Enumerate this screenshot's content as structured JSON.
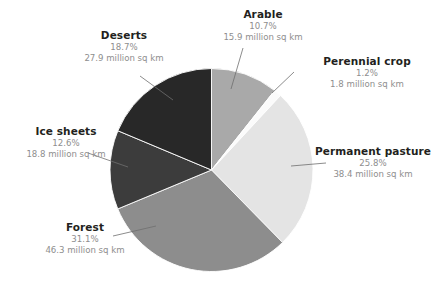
{
  "chart_data": {
    "type": "pie",
    "title": "",
    "subtitle": "",
    "unit": "million sq km",
    "legend_position": "callout-labels",
    "grid": false,
    "start_angle_deg": 0,
    "direction": "clockwise",
    "categories": [
      "Arable",
      "Perennial crop",
      "Permanent pasture",
      "Forest",
      "Ice sheets",
      "Deserts"
    ],
    "values": [
      10.7,
      1.2,
      25.8,
      31.1,
      12.6,
      18.7
    ],
    "absolute_values": [
      15.9,
      1.8,
      38.4,
      46.3,
      18.8,
      27.9
    ],
    "slices": [
      {
        "name": "Arable",
        "percent_label": "10.7%",
        "percent": 10.7,
        "value_label": "15.9 million sq km",
        "value": 15.9,
        "color": "#a9a9a9"
      },
      {
        "name": "Perennial crop",
        "percent_label": "1.2%",
        "percent": 1.2,
        "value_label": "1.8 million sq km",
        "value": 1.8,
        "color": "#fbfbfb"
      },
      {
        "name": "Permanent pasture",
        "percent_label": "25.8%",
        "percent": 25.8,
        "value_label": "38.4 million sq km",
        "value": 38.4,
        "color": "#e4e4e4"
      },
      {
        "name": "Forest",
        "percent_label": "31.1%",
        "percent": 31.1,
        "value_label": "46.3 million sq km",
        "value": 46.3,
        "color": "#8d8d8d"
      },
      {
        "name": "Ice sheets",
        "percent_label": "12.6%",
        "percent": 12.6,
        "value_label": "18.8 million sq km",
        "value": 18.8,
        "color": "#3c3c3c"
      },
      {
        "name": "Deserts",
        "percent_label": "18.7%",
        "percent": 18.7,
        "value_label": "27.9 million sq km",
        "value": 27.9,
        "color": "#282828"
      }
    ]
  },
  "style": {
    "background": "#ffffff",
    "label_title_color": "#231f20",
    "label_value_color": "#8e8e8e",
    "leader_line_color": "#6e6e6e"
  }
}
